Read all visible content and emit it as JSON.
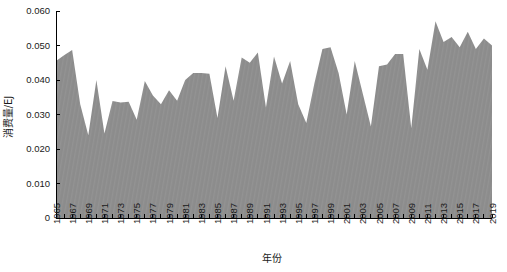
{
  "chart_data": {
    "type": "area",
    "title": "",
    "xlabel": "年份",
    "ylabel": "消费量/EJ",
    "xlim": [
      1965,
      2019
    ],
    "ylim": [
      0,
      0.06
    ],
    "yticks": [
      0,
      0.01,
      0.02,
      0.03,
      0.04,
      0.05,
      0.06
    ],
    "ytick_labels": [
      "0",
      "0.010",
      "0.020",
      "0.030",
      "0.040",
      "0.050",
      "0.060"
    ],
    "grid": false,
    "legend": null,
    "fill_color": "#8c8c8c",
    "x": [
      1965,
      1966,
      1967,
      1968,
      1969,
      1970,
      1971,
      1972,
      1973,
      1974,
      1975,
      1976,
      1977,
      1978,
      1979,
      1980,
      1981,
      1982,
      1983,
      1984,
      1985,
      1986,
      1987,
      1988,
      1989,
      1990,
      1991,
      1992,
      1993,
      1994,
      1995,
      1996,
      1997,
      1998,
      1999,
      2000,
      2001,
      2002,
      2003,
      2004,
      2005,
      2006,
      2007,
      2008,
      2009,
      2010,
      2011,
      2012,
      2013,
      2014,
      2015,
      2016,
      2017,
      2018,
      2019
    ],
    "xtick_labels": [
      "1965",
      "1967",
      "1969",
      "1971",
      "1973",
      "1975",
      "1977",
      "1979",
      "1981",
      "1983",
      "1985",
      "1987",
      "1989",
      "1991",
      "1993",
      "1995",
      "1997",
      "1999",
      "2001",
      "2003",
      "2005",
      "2007",
      "2009",
      "2011",
      "2013",
      "2015",
      "2017",
      "2019"
    ],
    "values": [
      0.0455,
      0.0472,
      0.0487,
      0.033,
      0.024,
      0.04,
      0.0245,
      0.0339,
      0.0335,
      0.0337,
      0.0285,
      0.0397,
      0.0355,
      0.033,
      0.037,
      0.034,
      0.04,
      0.042,
      0.042,
      0.0418,
      0.029,
      0.044,
      0.034,
      0.0465,
      0.045,
      0.048,
      0.032,
      0.0468,
      0.039,
      0.0455,
      0.033,
      0.0275,
      0.039,
      0.049,
      0.0495,
      0.042,
      0.03,
      0.0455,
      0.036,
      0.0265,
      0.044,
      0.0445,
      0.0475,
      0.0475,
      0.026,
      0.049,
      0.043,
      0.057,
      0.051,
      0.0525,
      0.0495,
      0.054,
      0.049,
      0.052,
      0.05
    ]
  },
  "axes": {
    "y_axis_label": "消费量/EJ",
    "x_axis_label": "年份"
  }
}
